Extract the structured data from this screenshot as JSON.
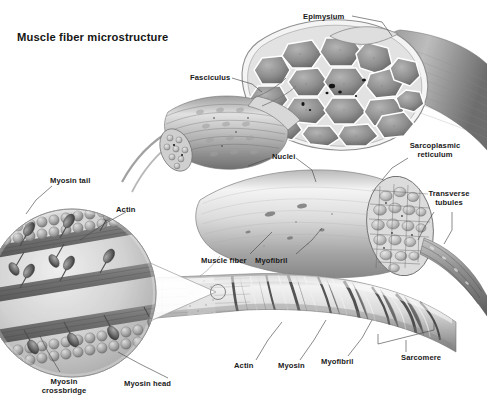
{
  "title": "Muscle fiber microstructure",
  "background_color": "#ffffff",
  "text_color": "#1a1a1a",
  "leader_line_color": "#4a4a4a",
  "illustration_style": "grayscale anatomical airbrush illustration",
  "labels": [
    {
      "id": "epimysium",
      "text": "Epimysium",
      "x": 303,
      "y": 12,
      "align": "left"
    },
    {
      "id": "fasciculus",
      "text": "Fasciculus",
      "x": 190,
      "y": 76,
      "align": "left"
    },
    {
      "id": "nuclei",
      "text": "Nuclei",
      "x": 272,
      "y": 154,
      "align": "left"
    },
    {
      "id": "sarcoplasmic-reticulum",
      "text": "Sarcoplasmic\nreticulum",
      "x": 410,
      "y": 144,
      "align": "left"
    },
    {
      "id": "transverse-tubules",
      "text": "Transverse\ntubules",
      "x": 424,
      "y": 192,
      "align": "left"
    },
    {
      "id": "myosin-tail",
      "text": "Myosin tail",
      "x": 50,
      "y": 178,
      "align": "left"
    },
    {
      "id": "actin-upper",
      "text": "Actin",
      "x": 116,
      "y": 207,
      "align": "left"
    },
    {
      "id": "muscle-fiber",
      "text": "Muscle fiber",
      "x": 203,
      "y": 258,
      "align": "left"
    },
    {
      "id": "myofibril-upper",
      "text": "Myofibril",
      "x": 256,
      "y": 258,
      "align": "left"
    },
    {
      "id": "actin-lower",
      "text": "Actin",
      "x": 234,
      "y": 364,
      "align": "left"
    },
    {
      "id": "myosin-lower",
      "text": "Myosin",
      "x": 279,
      "y": 364,
      "align": "left"
    },
    {
      "id": "myofibril-lower",
      "text": "Myofibril",
      "x": 322,
      "y": 360,
      "align": "left"
    },
    {
      "id": "sarcomere",
      "text": "Sarcomere",
      "x": 403,
      "y": 356,
      "align": "left"
    },
    {
      "id": "myosin-crossbridge",
      "text": "Myosin\ncrossbridge",
      "x": 62,
      "y": 381,
      "align": "center"
    },
    {
      "id": "myosin-head",
      "text": "Myosin head",
      "x": 125,
      "y": 381,
      "align": "left"
    }
  ],
  "structures": [
    {
      "id": "whole-muscle",
      "name": "whole muscle belly with epimysium sheath and cut cross-section of fascicles"
    },
    {
      "id": "fascicle-bundle",
      "name": "fasciculus - bundle of muscle fibers pulled out from the muscle"
    },
    {
      "id": "muscle-fiber-cyl",
      "name": "single muscle fiber cylinder showing nuclei and cut end with myofibrils"
    },
    {
      "id": "myofibril-band",
      "name": "myofibril with striated sarcomere banding pattern"
    },
    {
      "id": "magnifier-circle",
      "name": "magnified circular inset of actin and myosin filaments"
    }
  ],
  "palette": {
    "light_gray": "#e9e9e9",
    "mid_gray": "#b9b9b9",
    "dark_gray": "#7d7d7d",
    "deep_gray": "#4e4e4e",
    "near_black": "#272727",
    "highlight": "#f6f6f6"
  }
}
